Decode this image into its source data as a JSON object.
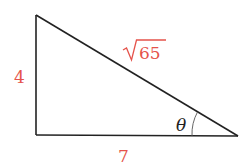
{
  "diagram": {
    "type": "right-triangle",
    "vertices": {
      "top": [
        36,
        15
      ],
      "right_angle": [
        36,
        135
      ],
      "acute": [
        238,
        136
      ]
    },
    "labels": {
      "vertical_side": "4",
      "horizontal_side": "7",
      "hypotenuse_radicand": "65",
      "angle": "θ"
    },
    "colors": {
      "stroke": "#222222",
      "label": "#e5534b",
      "arc": "#555555"
    }
  }
}
